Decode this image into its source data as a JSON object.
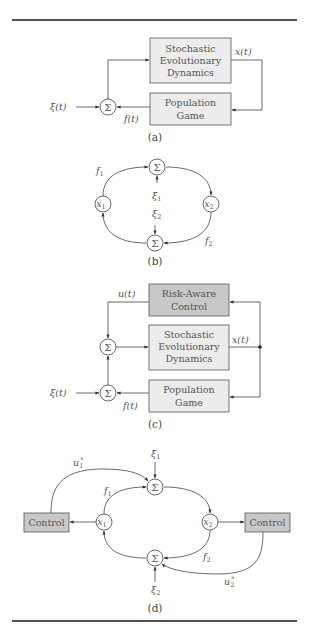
{
  "figure": {
    "panels": [
      {
        "caption": "(a)",
        "blocks": [
          {
            "id": "dynamics",
            "lines": [
              "Stochastic",
              "Evolutionary",
              "Dynamics"
            ],
            "shade": "light"
          },
          {
            "id": "game",
            "lines": [
              "Population",
              "Game"
            ],
            "shade": "light"
          }
        ],
        "nodes": [
          {
            "id": "sum",
            "symbol": "Σ"
          }
        ],
        "signals": {
          "input": "ξ(t)",
          "state": "x(t)",
          "payoff": "f(t)"
        }
      },
      {
        "caption": "(b)",
        "nodes": [
          {
            "id": "sum_top",
            "symbol": "Σ"
          },
          {
            "id": "x1",
            "symbol": "x",
            "sub": "1"
          },
          {
            "id": "x2",
            "symbol": "x",
            "sub": "2"
          },
          {
            "id": "sum_bottom",
            "symbol": "Σ"
          }
        ],
        "signals": {
          "f1": "f",
          "f1_sub": "1",
          "f2": "f",
          "f2_sub": "2",
          "xi1": "ξ",
          "xi1_sub": "1",
          "xi2": "ξ",
          "xi2_sub": "2"
        }
      },
      {
        "caption": "(c)",
        "blocks": [
          {
            "id": "control",
            "lines": [
              "Risk-Aware",
              "Control"
            ],
            "shade": "dark"
          },
          {
            "id": "dynamics",
            "lines": [
              "Stochastic",
              "Evolutionary",
              "Dynamics"
            ],
            "shade": "light"
          },
          {
            "id": "game",
            "lines": [
              "Population",
              "Game"
            ],
            "shade": "light"
          }
        ],
        "nodes": [
          {
            "id": "sum_upper",
            "symbol": "Σ"
          },
          {
            "id": "sum_lower",
            "symbol": "Σ"
          }
        ],
        "signals": {
          "control": "u(t)",
          "input": "ξ(t)",
          "state": "x(t)",
          "payoff": "f(t)"
        }
      },
      {
        "caption": "(d)",
        "blocks": [
          {
            "id": "control_left",
            "lines": [
              "Control"
            ],
            "shade": "dark"
          },
          {
            "id": "control_right",
            "lines": [
              "Control"
            ],
            "shade": "dark"
          }
        ],
        "nodes": [
          {
            "id": "sum_top",
            "symbol": "Σ"
          },
          {
            "id": "x1",
            "symbol": "x",
            "sub": "1"
          },
          {
            "id": "x2",
            "symbol": "x",
            "sub": "2"
          },
          {
            "id": "sum_bottom",
            "symbol": "Σ"
          }
        ],
        "signals": {
          "u1": "u",
          "u1_sub": "1",
          "u1_sup": "*",
          "u2": "u",
          "u2_sub": "2",
          "u2_sup": "*",
          "f1": "f",
          "f1_sub": "1",
          "f2": "f",
          "f2_sub": "2",
          "xi1": "ξ",
          "xi1_sub": "1",
          "xi2": "ξ",
          "xi2_sub": "2"
        }
      }
    ]
  },
  "colors": {
    "block_light": "#ececec",
    "block_dark": "#c8c8c8",
    "line": "#444444",
    "text": "#555555"
  }
}
